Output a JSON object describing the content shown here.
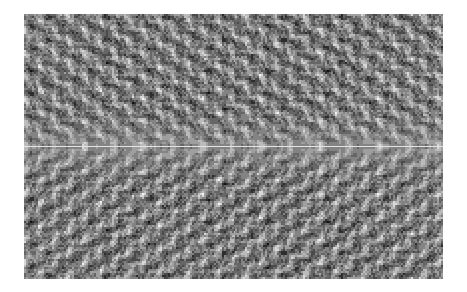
{
  "figure": {
    "background_color": "#ffffff",
    "width": 467,
    "height": 292
  },
  "plot": {
    "left": 24,
    "top": 14,
    "width": 419,
    "height": 265,
    "border": "none"
  },
  "chart_data": {
    "type": "heatmap",
    "title": "",
    "subtitle": "",
    "xlabel": "",
    "ylabel": "",
    "legend": [],
    "annotations": [],
    "grid": false,
    "colormap": "gray",
    "colormap_min_hex": "#111111",
    "colormap_max_hex": "#f4f4f4",
    "value_range": [
      0,
      1
    ],
    "n_cols": 210,
    "n_rows": 133,
    "cell_width_px": 2,
    "cell_height_px": 2,
    "xlim": [
      0,
      210
    ],
    "ylim": [
      0,
      133
    ],
    "xticks": [],
    "yticks": [],
    "xticklabels": [],
    "yticklabels": [],
    "structure": {
      "description": "interference / spectral magnitude pattern, mirror-symmetric about the horizontal mid-row",
      "symmetry_axis_row": 66,
      "bright_center_row_index": 66,
      "bright_center_row_value": 0.93,
      "horizontal_period_cols": 14.8,
      "vertical_period_rows": 11.4,
      "mean_value": 0.52,
      "std_value": 0.27,
      "seed": 20240607,
      "carrier_terms": [
        {
          "kx": 0.4244,
          "ky": 0.5512,
          "amp": 0.52,
          "phase": 0.0
        },
        {
          "kx": 0.8488,
          "ky": 0.0,
          "amp": 0.34,
          "phase": 1.05
        },
        {
          "kx": 0.2122,
          "ky": 1.1024,
          "amp": 0.28,
          "phase": 2.1
        },
        {
          "kx": 1.2732,
          "ky": 0.5512,
          "amp": 0.22,
          "phase": 0.6
        },
        {
          "kx": 0.0,
          "ky": 1.6536,
          "amp": 0.18,
          "phase": 3.0
        },
        {
          "kx": 1.6976,
          "ky": 1.1024,
          "amp": 0.14,
          "phase": 1.8
        }
      ],
      "envelope": {
        "center_brightening": 0.3,
        "center_sigma_rows": 7.5,
        "edge_fade": 0.06
      },
      "quantization_levels": 9,
      "noise_amplitude": 0.3
    }
  }
}
